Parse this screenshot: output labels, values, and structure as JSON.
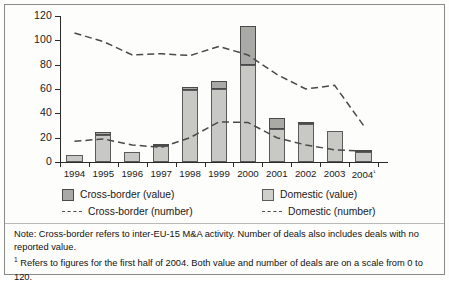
{
  "chart_data": {
    "type": "bar",
    "title": "",
    "subtitle": "",
    "xlabel": "",
    "ylabel": "",
    "ylim": [
      0,
      120
    ],
    "yticks": [
      0,
      20,
      40,
      60,
      80,
      100,
      120
    ],
    "grid": false,
    "legend_position": "below-plot",
    "categories": [
      "1994",
      "1995",
      "1996",
      "1997",
      "1998",
      "1999",
      "2000",
      "2001",
      "2002",
      "2003",
      "2004"
    ],
    "category_labels": [
      "1994",
      "1995",
      "1996",
      "1997",
      "1998",
      "1999",
      "2000",
      "2001",
      "2002",
      "2003",
      "2004¹"
    ],
    "series": [
      {
        "name": "Domestic (value)",
        "type": "bar-stack-bottom",
        "color": "#c8c8c4",
        "values": [
          5.5,
          22.0,
          8.0,
          13.0,
          59.5,
          60.0,
          80.0,
          27.0,
          31.0,
          25.5,
          8.0
        ]
      },
      {
        "name": "Cross-border (value)",
        "type": "bar-stack-top",
        "color": "#a9a9a5",
        "values": [
          0.0,
          2.5,
          0.0,
          1.5,
          2.0,
          6.5,
          32.0,
          9.0,
          2.0,
          0.0,
          1.0
        ]
      },
      {
        "name": "Cross-border (number)",
        "type": "line-dashed",
        "color": "#4a4a4a",
        "values": [
          17,
          19,
          14,
          12,
          20,
          33,
          32.5,
          20,
          14,
          10,
          9
        ]
      },
      {
        "name": "Domestic (number)",
        "type": "line-dashed",
        "color": "#4a4a4a",
        "values": [
          106,
          99,
          88,
          89,
          87.5,
          95,
          88,
          72,
          60,
          63,
          30
        ]
      }
    ],
    "totals": [
      5.5,
      24.5,
      8.0,
      14.5,
      61.5,
      66.5,
      112.0,
      36.0,
      33.0,
      25.5,
      9.0
    ]
  },
  "legend": {
    "items": [
      {
        "label": "Cross-border (value)",
        "marker": "swatch-cross"
      },
      {
        "label": "Domestic (value)",
        "marker": "swatch-domestic"
      },
      {
        "label": "Cross-border (number)",
        "marker": "dashed-line"
      },
      {
        "label": "Domestic (number)",
        "marker": "dashed-line"
      }
    ]
  },
  "notes": {
    "note_line": "Note: Cross-border refers to inter-EU-15 M&A activity. Number of deals also includes deals with no reported value.",
    "footnote_marker": "1",
    "footnote_line": "Refers to figures for the first half of 2004. Both value and number of deals are on a scale from 0 to 120."
  }
}
